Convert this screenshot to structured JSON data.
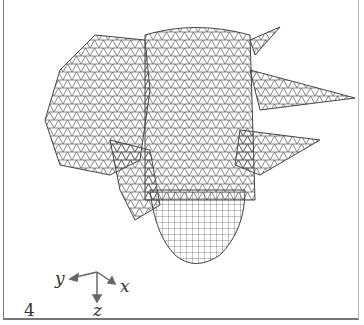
{
  "figure": {
    "panel_label": "4",
    "axes": {
      "x_label": "x",
      "y_label": "y",
      "z_label": "z"
    },
    "colors": {
      "mesh": "#555555",
      "frame": "#777777",
      "background": "#ffffff"
    }
  }
}
